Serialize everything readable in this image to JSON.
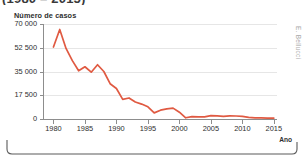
{
  "title_partial": "(1980 – 2015)",
  "credit": "E. Bellucci",
  "axis": {
    "y_label": "Número de casos",
    "x_label": "Ano"
  },
  "chart_data": {
    "type": "line",
    "title": "(1980 – 2015)",
    "xlabel": "Ano",
    "ylabel": "Número de casos",
    "xlim": [
      1978.5,
      2015.5
    ],
    "ylim": [
      0,
      70000
    ],
    "grid": true,
    "legend": "none",
    "line_color": "#e05a42",
    "y_ticks": [
      0,
      17500,
      35000,
      52500,
      70000
    ],
    "y_tick_labels": [
      "0",
      "17 500",
      "35 000",
      "52 500",
      "70 000"
    ],
    "x_ticks": [
      1980,
      1985,
      1990,
      1995,
      2000,
      2005,
      2010,
      2015
    ],
    "x_tick_labels": [
      "1980",
      "1985",
      "1990",
      "1995",
      "2000",
      "2005",
      "2010",
      "2015"
    ],
    "series": [
      {
        "name": "Número de casos",
        "x": [
          1980,
          1981,
          1982,
          1983,
          1984,
          1985,
          1986,
          1987,
          1988,
          1989,
          1990,
          1991,
          1992,
          1993,
          1994,
          1995,
          1996,
          1997,
          1998,
          1999,
          2000,
          2001,
          2002,
          2003,
          2004,
          2005,
          2006,
          2007,
          2008,
          2009,
          2010,
          2011,
          2012,
          2013,
          2014,
          2015
        ],
        "values": [
          53000,
          66000,
          52000,
          43000,
          35500,
          38500,
          34500,
          40000,
          35000,
          26000,
          22500,
          14500,
          15500,
          12500,
          11000,
          9000,
          4500,
          6500,
          7500,
          8000,
          5000,
          900,
          1800,
          1500,
          1600,
          2500,
          2300,
          2000,
          2300,
          2200,
          2000,
          1200,
          900,
          800,
          700,
          600
        ]
      }
    ]
  }
}
